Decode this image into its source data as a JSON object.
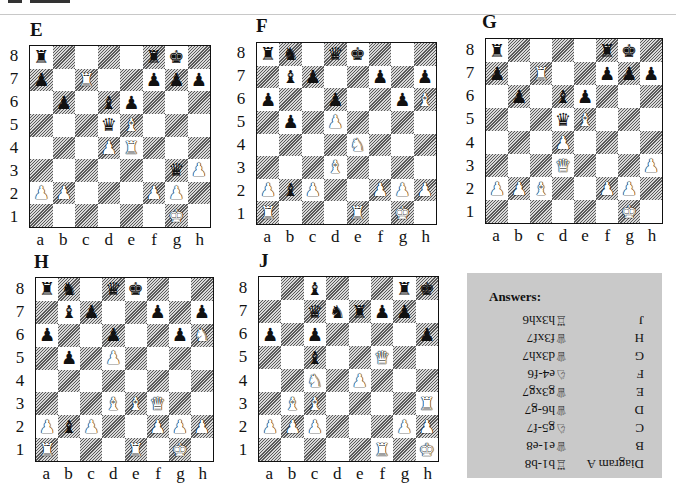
{
  "page": {
    "top_rule": true
  },
  "diagrams": [
    {
      "id": "E",
      "title": "E",
      "title_pos": [
        30,
        20
      ],
      "board": [
        29,
        45,
        182,
        183
      ],
      "position": [
        [
          "br",
          "",
          "",
          "",
          "",
          "br",
          "bk",
          ""
        ],
        [
          "bp",
          "",
          "wr",
          "",
          "",
          "bp",
          "bp",
          "bp"
        ],
        [
          "",
          "bp",
          "",
          "bb",
          "bp",
          "",
          "",
          ""
        ],
        [
          "",
          "",
          "",
          "bq",
          "wb",
          "",
          "",
          ""
        ],
        [
          "",
          "",
          "",
          "wp",
          "wr",
          "",
          "",
          ""
        ],
        [
          "",
          "",
          "",
          "",
          "",
          "",
          "bq",
          "wp"
        ],
        [
          "wp",
          "wp",
          "",
          "",
          "",
          "wp",
          "wp",
          ""
        ],
        [
          "",
          "",
          "",
          "",
          "",
          "",
          "wk",
          ""
        ]
      ]
    },
    {
      "id": "F",
      "title": "F",
      "title_pos": [
        256,
        16
      ],
      "board": [
        256,
        42,
        181,
        183
      ],
      "position": [
        [
          "br",
          "bn",
          "",
          "bq",
          "bk",
          "",
          "",
          ""
        ],
        [
          "",
          "bb",
          "bp",
          "",
          "",
          "bp",
          "",
          "bp"
        ],
        [
          "bp",
          "",
          "",
          "bp",
          "",
          "",
          "bp",
          "wb"
        ],
        [
          "",
          "bp",
          "",
          "wp",
          "",
          "",
          "",
          ""
        ],
        [
          "",
          "",
          "",
          "",
          "wn",
          "",
          "",
          ""
        ],
        [
          "",
          "",
          "",
          "wb",
          "",
          "",
          "",
          ""
        ],
        [
          "wp",
          "bb",
          "wp",
          "",
          "",
          "wp",
          "wp",
          "wp"
        ],
        [
          "wr",
          "",
          "",
          "",
          "wr",
          "",
          "wk",
          ""
        ]
      ]
    },
    {
      "id": "G",
      "title": "G",
      "title_pos": [
        482,
        12
      ],
      "board": [
        485,
        38,
        178,
        186
      ],
      "position": [
        [
          "br",
          "",
          "",
          "",
          "",
          "br",
          "bk",
          ""
        ],
        [
          "bp",
          "",
          "wr",
          "",
          "",
          "bp",
          "bp",
          "bp"
        ],
        [
          "",
          "bp",
          "",
          "bb",
          "bp",
          "",
          "",
          ""
        ],
        [
          "",
          "",
          "",
          "bq",
          "wb",
          "",
          "",
          ""
        ],
        [
          "",
          "",
          "",
          "wp",
          "",
          "",
          "",
          ""
        ],
        [
          "",
          "",
          "",
          "wq",
          "",
          "",
          "",
          "wp"
        ],
        [
          "wp",
          "wp",
          "wb",
          "",
          "",
          "wp",
          "wp",
          ""
        ],
        [
          "",
          "",
          "",
          "",
          "",
          "",
          "wk",
          ""
        ]
      ]
    },
    {
      "id": "H",
      "title": "H",
      "title_pos": [
        34,
        252
      ],
      "board": [
        35,
        277,
        179,
        185
      ],
      "position": [
        [
          "br",
          "bn",
          "",
          "bq",
          "bk",
          "",
          "",
          ""
        ],
        [
          "",
          "bb",
          "bp",
          "",
          "",
          "bp",
          "",
          "bp"
        ],
        [
          "bp",
          "",
          "",
          "bp",
          "",
          "",
          "bp",
          "wn"
        ],
        [
          "",
          "bp",
          "",
          "wp",
          "",
          "",
          "",
          ""
        ],
        [
          "",
          "",
          "",
          "",
          "",
          "",
          "",
          ""
        ],
        [
          "",
          "",
          "",
          "wb",
          "wb",
          "wq",
          "",
          ""
        ],
        [
          "wp",
          "bb",
          "wp",
          "",
          "",
          "wp",
          "wp",
          "wp"
        ],
        [
          "wr",
          "",
          "",
          "",
          "wr",
          "",
          "wk",
          ""
        ]
      ]
    },
    {
      "id": "J",
      "title": "J",
      "title_pos": [
        259,
        251
      ],
      "board": [
        258,
        276,
        181,
        186
      ],
      "position": [
        [
          "",
          "",
          "bb",
          "",
          "",
          "",
          "br",
          "bk"
        ],
        [
          "",
          "",
          "bq",
          "bn",
          "br",
          "bp",
          "bp",
          ""
        ],
        [
          "bp",
          "",
          "bp",
          "",
          "",
          "",
          "",
          "bp"
        ],
        [
          "",
          "",
          "bb",
          "",
          "",
          "wq",
          "",
          ""
        ],
        [
          "",
          "",
          "wn",
          "",
          "wp",
          "",
          "",
          ""
        ],
        [
          "",
          "wb",
          "wb",
          "",
          "",
          "",
          "",
          "wr"
        ],
        [
          "wp",
          "wp",
          "wp",
          "",
          "",
          "",
          "wp",
          "wp"
        ],
        [
          "",
          "",
          "",
          "",
          "",
          "wr",
          "",
          "wk"
        ]
      ]
    }
  ],
  "files": [
    "a",
    "b",
    "c",
    "d",
    "e",
    "f",
    "g",
    "h"
  ],
  "ranks": [
    "8",
    "7",
    "6",
    "5",
    "4",
    "3",
    "2",
    "1"
  ],
  "piece_glyphs": {
    "k": "♚",
    "q": "♛",
    "r": "♜",
    "b": "♝",
    "n": "♞",
    "p": "♟"
  },
  "answers": {
    "title": "Answers:",
    "rows": [
      {
        "label": "Diagram A",
        "move": "♖b1-b8"
      },
      {
        "label": "B",
        "move": "♕e1-e8"
      },
      {
        "label": "C",
        "move": "♘g5-f7"
      },
      {
        "label": "D",
        "move": "♕h6-g7"
      },
      {
        "label": "E",
        "move": "♕g3xg7"
      },
      {
        "label": "F",
        "move": "♘e4-f6"
      },
      {
        "label": "G",
        "move": "♕d3xh7"
      },
      {
        "label": "H",
        "move": "♕f3xf7"
      },
      {
        "label": "J",
        "move": "♖h3xh6"
      }
    ],
    "rendered_upside_down": true
  },
  "colors": {
    "answers_bg": "#c9c9c9",
    "dark_square_hatch": "#5a5a5a",
    "border": "#111111"
  }
}
